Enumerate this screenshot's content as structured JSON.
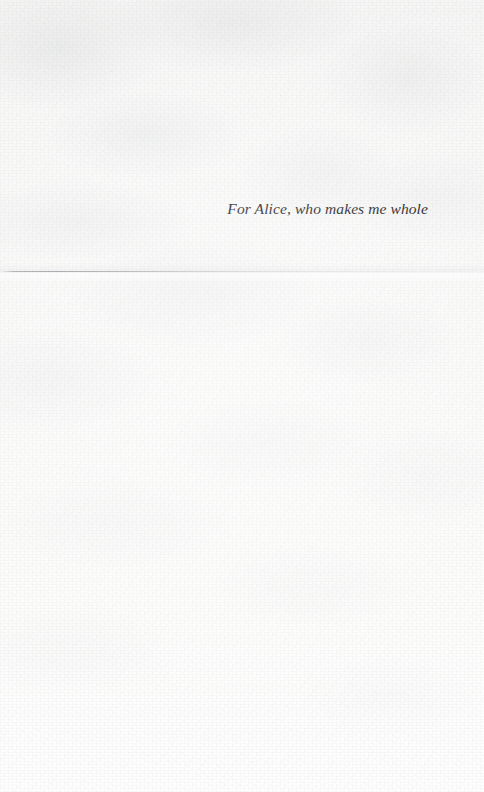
{
  "page": {
    "kind": "book-dedication-page",
    "paper_color": "#fbfbfa",
    "ink_color": "#20201f"
  },
  "dedication": {
    "text": "For Alice, who makes me whole"
  },
  "marks": {
    "crease_label": "horizontal fold crease",
    "crease_color": "#84868a"
  }
}
